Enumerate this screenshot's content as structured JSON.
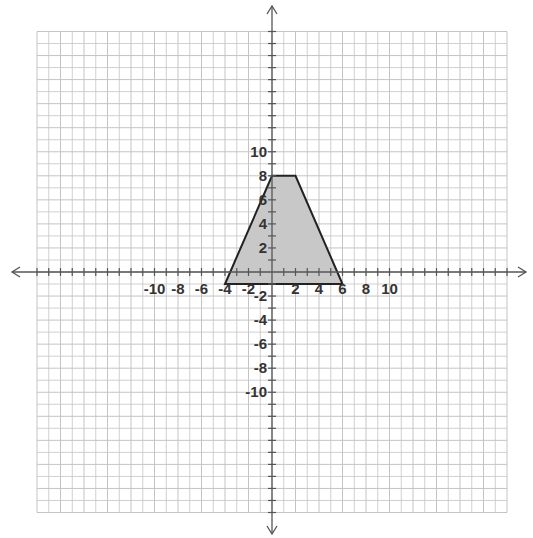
{
  "chart_data": {
    "type": "polygon",
    "title": "",
    "xlabel": "",
    "ylabel": "",
    "xlim": [
      -10,
      10
    ],
    "ylim": [
      -10,
      10
    ],
    "grid": true,
    "grid_step": 1,
    "x_tick_labels": [
      "-10",
      "-8",
      "-6",
      "-4",
      "-2",
      "2",
      "4",
      "6",
      "8",
      "10"
    ],
    "y_tick_labels": [
      "10",
      "8",
      "6",
      "4",
      "2",
      "-2",
      "-4",
      "-6",
      "-8",
      "-10"
    ],
    "x_ticks": [
      -10,
      -8,
      -6,
      -4,
      -2,
      2,
      4,
      6,
      8,
      10
    ],
    "y_ticks": [
      10,
      8,
      6,
      4,
      2,
      -2,
      -4,
      -6,
      -8,
      -10
    ],
    "shape": {
      "name": "trapezoid",
      "vertices": [
        [
          0,
          8
        ],
        [
          2,
          8
        ],
        [
          6,
          -1
        ],
        [
          -4,
          -1
        ]
      ],
      "fill": "#c8c8c8",
      "stroke": "#222222"
    },
    "axes_arrows": true
  },
  "colors": {
    "grid": "#c4c4c4",
    "axis": "#555555",
    "fill": "#c8c8c8",
    "stroke": "#222222",
    "label": "#333333"
  }
}
